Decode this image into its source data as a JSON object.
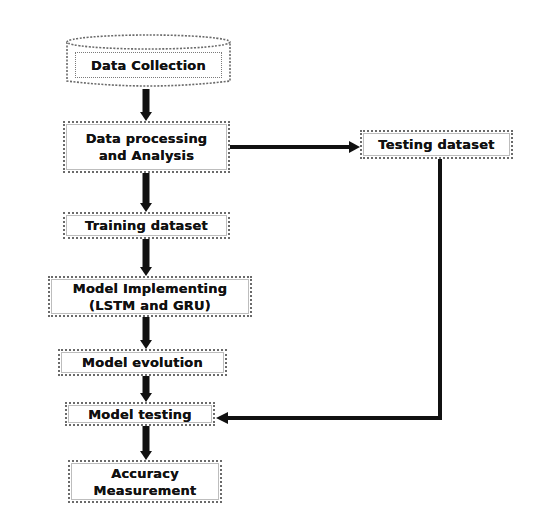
{
  "diagram": {
    "type": "flowchart",
    "nodes": {
      "data_collection": {
        "label": "Data Collection",
        "shape": "cylinder"
      },
      "data_processing": {
        "line1": "Data processing",
        "line2": "and Analysis",
        "shape": "box"
      },
      "testing_dataset": {
        "label": "Testing dataset",
        "shape": "box"
      },
      "training_dataset": {
        "label": "Training dataset",
        "shape": "box"
      },
      "model_implementing": {
        "line1": "Model Implementing",
        "line2": "(LSTM and GRU)",
        "shape": "box"
      },
      "model_evolution": {
        "label": "Model evolution",
        "shape": "box"
      },
      "model_testing": {
        "label": "Model testing",
        "shape": "box"
      },
      "accuracy_measurement": {
        "line1": "Accuracy",
        "line2": "Measurement",
        "shape": "box"
      }
    },
    "edges": [
      {
        "from": "Data Collection",
        "to": "Data processing and Analysis"
      },
      {
        "from": "Data processing and Analysis",
        "to": "Testing dataset"
      },
      {
        "from": "Data processing and Analysis",
        "to": "Training dataset"
      },
      {
        "from": "Training dataset",
        "to": "Model Implementing (LSTM and GRU)"
      },
      {
        "from": "Model Implementing (LSTM and GRU)",
        "to": "Model evolution"
      },
      {
        "from": "Model evolution",
        "to": "Model testing"
      },
      {
        "from": "Testing dataset",
        "to": "Model testing"
      },
      {
        "from": "Model testing",
        "to": "Accuracy Measurement"
      }
    ],
    "colors": {
      "arrow": "#111111",
      "border": "#6a6a6a",
      "background": "#ffffff",
      "text": "#111111"
    }
  }
}
